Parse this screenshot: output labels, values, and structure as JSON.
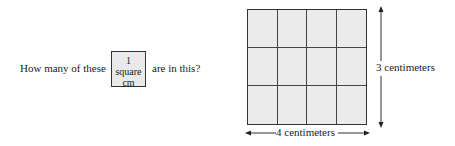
{
  "question": {
    "prefix": "How many of these",
    "suffix": "are in this?"
  },
  "unit_square": {
    "line1": "1 square",
    "line2": "cm"
  },
  "rectangle": {
    "columns": 4,
    "rows": 3,
    "fill": "#ebebeb"
  },
  "labels": {
    "height": "3 centimeters",
    "width": "4 centimeters"
  }
}
